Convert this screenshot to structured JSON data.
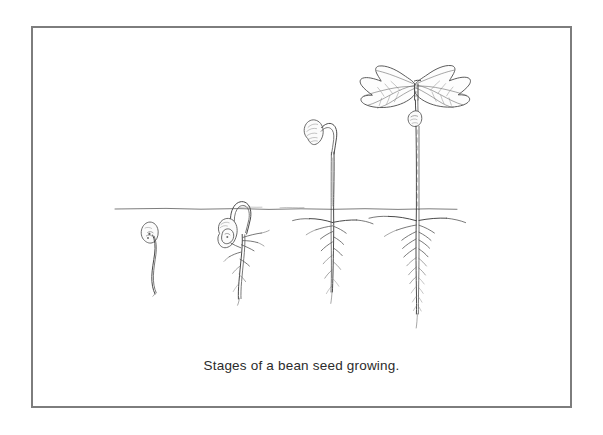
{
  "figure": {
    "caption": "Stages of a bean seed growing.",
    "border_color": "#7d7d7d",
    "background_color": "#ffffff",
    "ink_color": "#4a4a4a",
    "soil_line_label": "soil line"
  },
  "stages": [
    {
      "index": 1,
      "name": "germinating-seed",
      "description": "Bean seed below soil with a single emerging radicle root"
    },
    {
      "index": 2,
      "name": "seedling-hook-emerging",
      "description": "Seed with hooked shoot breaking the soil surface and branching roots"
    },
    {
      "index": 3,
      "name": "seedling-with-seed-coat",
      "description": "Tall stem above soil carrying the seed coat on a hooked tip, long taproot with side roots"
    },
    {
      "index": 4,
      "name": "seedling-with-leaves",
      "description": "Upright plant with two large opened leaves, spent seed coat on stem, deep branching taproot"
    }
  ]
}
